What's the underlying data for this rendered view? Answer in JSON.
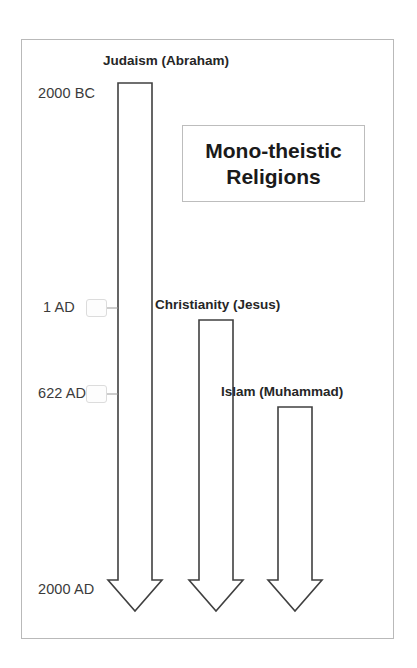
{
  "figure": {
    "kind": "timeline-diagram",
    "title_card": {
      "line1": "Mono-theistic",
      "line2": "Religions"
    },
    "colors": {
      "arrow_stroke": "#404040",
      "arrow_fill": "#ffffff",
      "frame_border": "#b9b9b9",
      "text": "#262626",
      "date_text": "#3b3b3b",
      "tick_line": "#9a9a9a"
    }
  },
  "axis": {
    "name": "time-axis",
    "direction": "top-to-bottom",
    "labels": [
      {
        "id": "start",
        "text": "2000 BC",
        "year": -2000
      },
      {
        "id": "ad1",
        "text": "1 AD",
        "year": 1
      },
      {
        "id": "ad622",
        "text": "622 AD",
        "year": 622
      },
      {
        "id": "end",
        "text": "2000 AD",
        "year": 2000
      }
    ]
  },
  "timelines": [
    {
      "id": "judaism",
      "label": "Judaism (Abraham)",
      "founder": "Abraham",
      "religion": "Judaism",
      "start_label": "2000 BC",
      "start_year": -2000,
      "end_label": "2000 AD",
      "end_year": 2000
    },
    {
      "id": "christianity",
      "label": "Christianity (Jesus)",
      "founder": "Jesus",
      "religion": "Christianity",
      "start_label": "1 AD",
      "start_year": 1,
      "end_label": "2000 AD",
      "end_year": 2000
    },
    {
      "id": "islam",
      "label": "Islam (Muhammad)",
      "founder": "Muhammad",
      "religion": "Islam",
      "start_label": "622 AD",
      "start_year": 622,
      "end_label": "2000 AD",
      "end_year": 2000
    }
  ]
}
